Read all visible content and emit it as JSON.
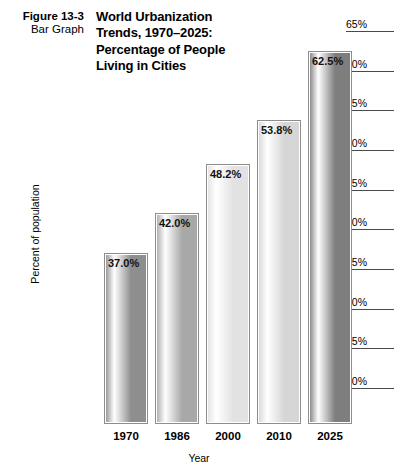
{
  "caption": {
    "figure_number": "Figure 13-3",
    "figure_type": "Bar Graph"
  },
  "chart_data": {
    "type": "bar",
    "title": "World Urbanization Trends, 1970–2025: Percentage of People Living in Cities",
    "title_lines": [
      "World Urbanization",
      "Trends, 1970–2025:",
      "Percentage of People",
      "Living in Cities"
    ],
    "categories": [
      "1970",
      "1986",
      "2000",
      "2010",
      "2025"
    ],
    "values": [
      37.0,
      42.0,
      48.2,
      53.8,
      62.5
    ],
    "value_labels": [
      "37.0%",
      "42.0%",
      "48.2%",
      "53.8%",
      "62.5%"
    ],
    "xlabel": "Year",
    "ylabel": "Percent of population",
    "ylim": [
      20,
      65
    ],
    "ytick_step": 5,
    "ytick_labels": [
      "65%",
      "60%",
      "55%",
      "50%",
      "45%",
      "40%",
      "35%",
      "30%",
      "25%",
      "20%"
    ],
    "ytick_values": [
      65,
      60,
      55,
      50,
      45,
      40,
      35,
      30,
      25,
      20
    ],
    "axis_position": "right",
    "grid": false,
    "legend": null,
    "bar_fills": [
      "#8e8e8e",
      "#a8a8a8",
      "#e2e2e2",
      "#d6d6d6",
      "#7e7e7e"
    ],
    "bar_border_color": "#8d8d8d"
  }
}
